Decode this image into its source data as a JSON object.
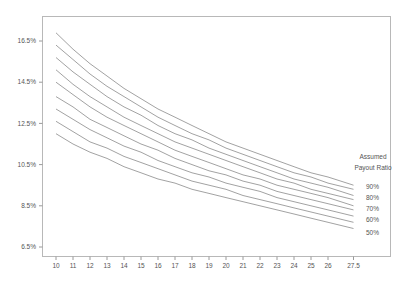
{
  "chart_data": {
    "type": "line",
    "title": "",
    "xlabel": "",
    "ylabel": "",
    "x": [
      10,
      11,
      12,
      13,
      14,
      15,
      16,
      17,
      18,
      19,
      20,
      21,
      22,
      23,
      24,
      25,
      26,
      27.5
    ],
    "x_tick_labels": [
      "10",
      "11",
      "12",
      "13",
      "14",
      "15",
      "16",
      "17",
      "18",
      "19",
      "20",
      "21",
      "22",
      "23",
      "24",
      "25",
      "26",
      "27.5"
    ],
    "y_tick_values": [
      16.5,
      14.5,
      12.5,
      10.5,
      8.5,
      6.5
    ],
    "y_tick_labels": [
      "16.5%",
      "14.5%",
      "12.5%",
      "10.5%",
      "8.5%",
      "6.5%"
    ],
    "ylim": [
      6.1,
      17.7
    ],
    "xlim": [
      9.2,
      29.2
    ],
    "grid": false,
    "legend": {
      "title_line1": "Assumed",
      "title_line2": "Payout Ratio",
      "position": "right",
      "labels": [
        "90%",
        "80%",
        "70%",
        "60%",
        "50%"
      ]
    },
    "series": [
      {
        "name": "90%",
        "values": [
          16.9,
          16.1,
          15.4,
          14.8,
          14.2,
          13.7,
          13.2,
          12.8,
          12.4,
          12.0,
          11.6,
          11.3,
          11.0,
          10.7,
          10.4,
          10.1,
          9.9,
          9.5
        ]
      },
      {
        "name": "85%",
        "values": [
          16.3,
          15.6,
          14.9,
          14.3,
          13.8,
          13.3,
          12.8,
          12.4,
          12.0,
          11.7,
          11.3,
          11.0,
          10.7,
          10.4,
          10.1,
          9.9,
          9.6,
          9.3
        ]
      },
      {
        "name": "80%",
        "values": [
          15.7,
          15.0,
          14.4,
          13.8,
          13.3,
          12.9,
          12.4,
          12.0,
          11.7,
          11.3,
          11.0,
          10.7,
          10.4,
          10.1,
          9.8,
          9.6,
          9.4,
          9.0
        ]
      },
      {
        "name": "75%",
        "values": [
          15.1,
          14.4,
          13.8,
          13.3,
          12.8,
          12.4,
          12.0,
          11.6,
          11.3,
          11.0,
          10.7,
          10.4,
          10.1,
          9.8,
          9.6,
          9.3,
          9.1,
          8.8
        ]
      },
      {
        "name": "70%",
        "values": [
          14.5,
          13.9,
          13.3,
          12.8,
          12.4,
          12.0,
          11.6,
          11.2,
          10.9,
          10.6,
          10.3,
          10.0,
          9.8,
          9.5,
          9.3,
          9.1,
          8.9,
          8.5
        ]
      },
      {
        "name": "65%",
        "values": [
          13.8,
          13.3,
          12.7,
          12.3,
          11.9,
          11.5,
          11.2,
          10.8,
          10.5,
          10.2,
          10.0,
          9.7,
          9.5,
          9.2,
          9.0,
          8.8,
          8.6,
          8.3
        ]
      },
      {
        "name": "60%",
        "values": [
          13.2,
          12.7,
          12.2,
          11.8,
          11.4,
          11.1,
          10.7,
          10.4,
          10.1,
          9.9,
          9.6,
          9.4,
          9.2,
          8.9,
          8.7,
          8.5,
          8.3,
          8.0
        ]
      },
      {
        "name": "55%",
        "values": [
          12.6,
          12.1,
          11.6,
          11.3,
          10.9,
          10.6,
          10.3,
          10.0,
          9.7,
          9.5,
          9.3,
          9.0,
          8.8,
          8.6,
          8.4,
          8.2,
          8.0,
          7.7
        ]
      },
      {
        "name": "50%",
        "values": [
          12.0,
          11.5,
          11.1,
          10.8,
          10.4,
          10.1,
          9.8,
          9.6,
          9.3,
          9.1,
          8.9,
          8.7,
          8.5,
          8.3,
          8.1,
          7.9,
          7.7,
          7.4
        ]
      }
    ]
  },
  "style": {
    "line_color": "#8a8a8a",
    "frame_color": "#b0b0b0",
    "axis_color": "#9a9a9a",
    "text_color": "#555555"
  }
}
